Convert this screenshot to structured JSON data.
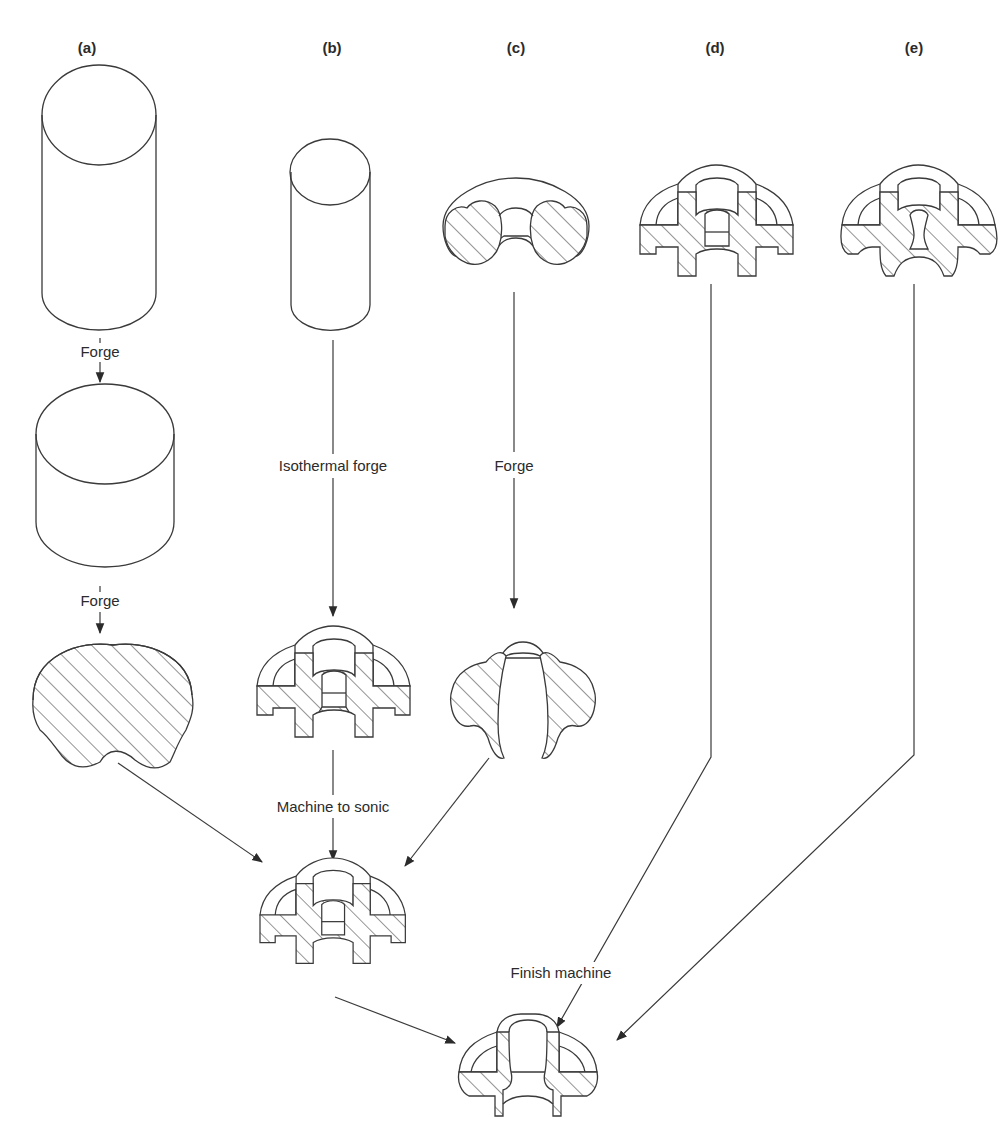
{
  "panels": [
    {
      "id": "a",
      "label": "(a)"
    },
    {
      "id": "b",
      "label": "(b)"
    },
    {
      "id": "c",
      "label": "(c)"
    },
    {
      "id": "d",
      "label": "(d)"
    },
    {
      "id": "e",
      "label": "(e)"
    }
  ],
  "steps": {
    "a_forge_1": "Forge",
    "a_forge_2": "Forge",
    "b_isothermal": "Isothermal forge",
    "c_forge": "Forge",
    "machine_to_sonic": "Machine to sonic",
    "finish_machine": "Finish machine"
  },
  "colors": {
    "line": "#3a3a3a",
    "text": "#2b2b2b",
    "background": "#ffffff"
  }
}
